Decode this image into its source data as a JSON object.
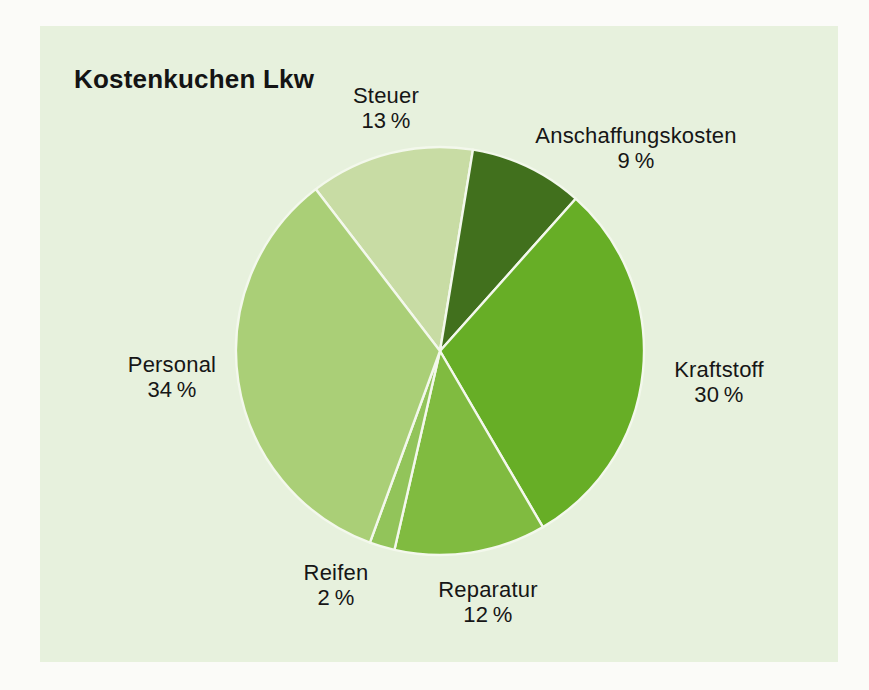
{
  "page": {
    "background": "#fbfbf8",
    "panel_background": "#e7f1dd",
    "text_color": "#161616"
  },
  "header": {
    "title": "Kostenkuchen Lkw"
  },
  "chart_data": {
    "type": "pie",
    "title": "Kostenkuchen Lkw",
    "value_unit": "%",
    "direction": "clockwise",
    "start_angle_deg_from_12_clockwise": -37.5,
    "separator_color": "#f3f8ec",
    "legend_position": "labels-around-pie",
    "order_clockwise": [
      "Steuer",
      "Anschaffungskosten",
      "Kraftstoff",
      "Reparatur",
      "Reifen",
      "Personal"
    ],
    "slices": [
      {
        "label": "Steuer",
        "value": 13,
        "pct_label": "13 %",
        "color": "#c8dca4"
      },
      {
        "label": "Anschaffungskosten",
        "value": 9,
        "pct_label": "9 %",
        "color": "#41701d"
      },
      {
        "label": "Kraftstoff",
        "value": 30,
        "pct_label": "30 %",
        "color": "#67ae26"
      },
      {
        "label": "Reparatur",
        "value": 12,
        "pct_label": "12 %",
        "color": "#80bb40"
      },
      {
        "label": "Reifen",
        "value": 2,
        "pct_label": "2 %",
        "color": "#92c45a"
      },
      {
        "label": "Personal",
        "value": 34,
        "pct_label": "34 %",
        "color": "#aacf77"
      }
    ]
  }
}
